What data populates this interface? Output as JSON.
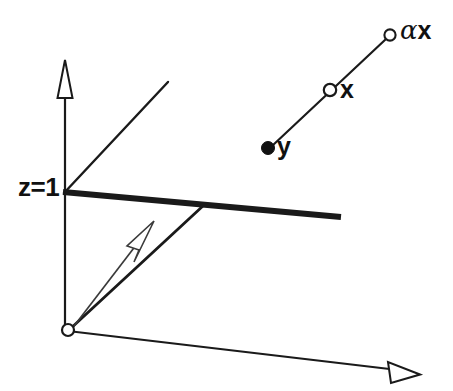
{
  "figure": {
    "background_color": "#ffffff",
    "stroke_color": "#1a1a1a",
    "width": 453,
    "height": 391,
    "labels": {
      "z_plane": "z=1",
      "alpha_symbol": "α",
      "alpha_x": "x",
      "point_x": "x",
      "point_y": "y"
    },
    "markers": [
      {
        "name": "origin",
        "style": "open-circle",
        "x": 68,
        "y": 330,
        "radius": 6
      },
      {
        "name": "point-y",
        "style": "filled-dot",
        "x": 268,
        "y": 148,
        "radius": 6
      },
      {
        "name": "point-x",
        "style": "open-circle",
        "x": 330,
        "y": 90,
        "radius": 6
      },
      {
        "name": "point-alpha-x",
        "style": "open-circle",
        "x": 390,
        "y": 35,
        "radius": 6
      }
    ],
    "axes": [
      {
        "name": "z-axis-vertical",
        "x1": 65,
        "y1": 330,
        "x2": 65,
        "y2": 62,
        "arrow": true,
        "width": 2
      },
      {
        "name": "x-axis-lower-right",
        "x1": 68,
        "y1": 331,
        "x2": 415,
        "y2": 372,
        "arrow": true,
        "width": 2
      }
    ],
    "lines": [
      {
        "name": "cone-edge-upper-left",
        "x1": 65,
        "y1": 192,
        "x2": 168,
        "y2": 82,
        "width": 2.2
      },
      {
        "name": "cone-edge-lower-right",
        "x1": 68,
        "y1": 330,
        "x2": 203,
        "y2": 206,
        "width": 2.6
      },
      {
        "name": "z-plane-thick-line",
        "x1": 64,
        "y1": 192,
        "x2": 341,
        "y2": 217,
        "width": 6
      },
      {
        "name": "interior-ray-arrow",
        "x1": 70,
        "y1": 330,
        "x2": 152,
        "y2": 224,
        "arrow": true,
        "width": 1.6
      },
      {
        "name": "ray-y-to-alpha-x",
        "x1": 272,
        "y1": 146,
        "x2": 387,
        "y2": 38,
        "width": 2.2
      }
    ]
  }
}
